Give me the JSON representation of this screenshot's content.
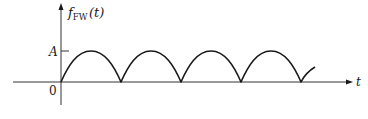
{
  "diagram": {
    "y_axis_label": {
      "func": "f",
      "subscript": "FW",
      "arg": "(t)"
    },
    "x_axis_label": "t",
    "origin_label": "0",
    "amplitude_label": "A",
    "colors": {
      "stroke": "#1a1a1a",
      "axis": "#333333",
      "background": "#ffffff"
    },
    "waveform": {
      "type": "full-wave rectified sinusoid |A sin(ωt)|",
      "zero_crossings_px": [
        61,
        121,
        181,
        241,
        301
      ],
      "peak_y_px": 51,
      "baseline_y_px": 82,
      "complete_arches": 4,
      "trailing_partial_rise": true
    }
  }
}
